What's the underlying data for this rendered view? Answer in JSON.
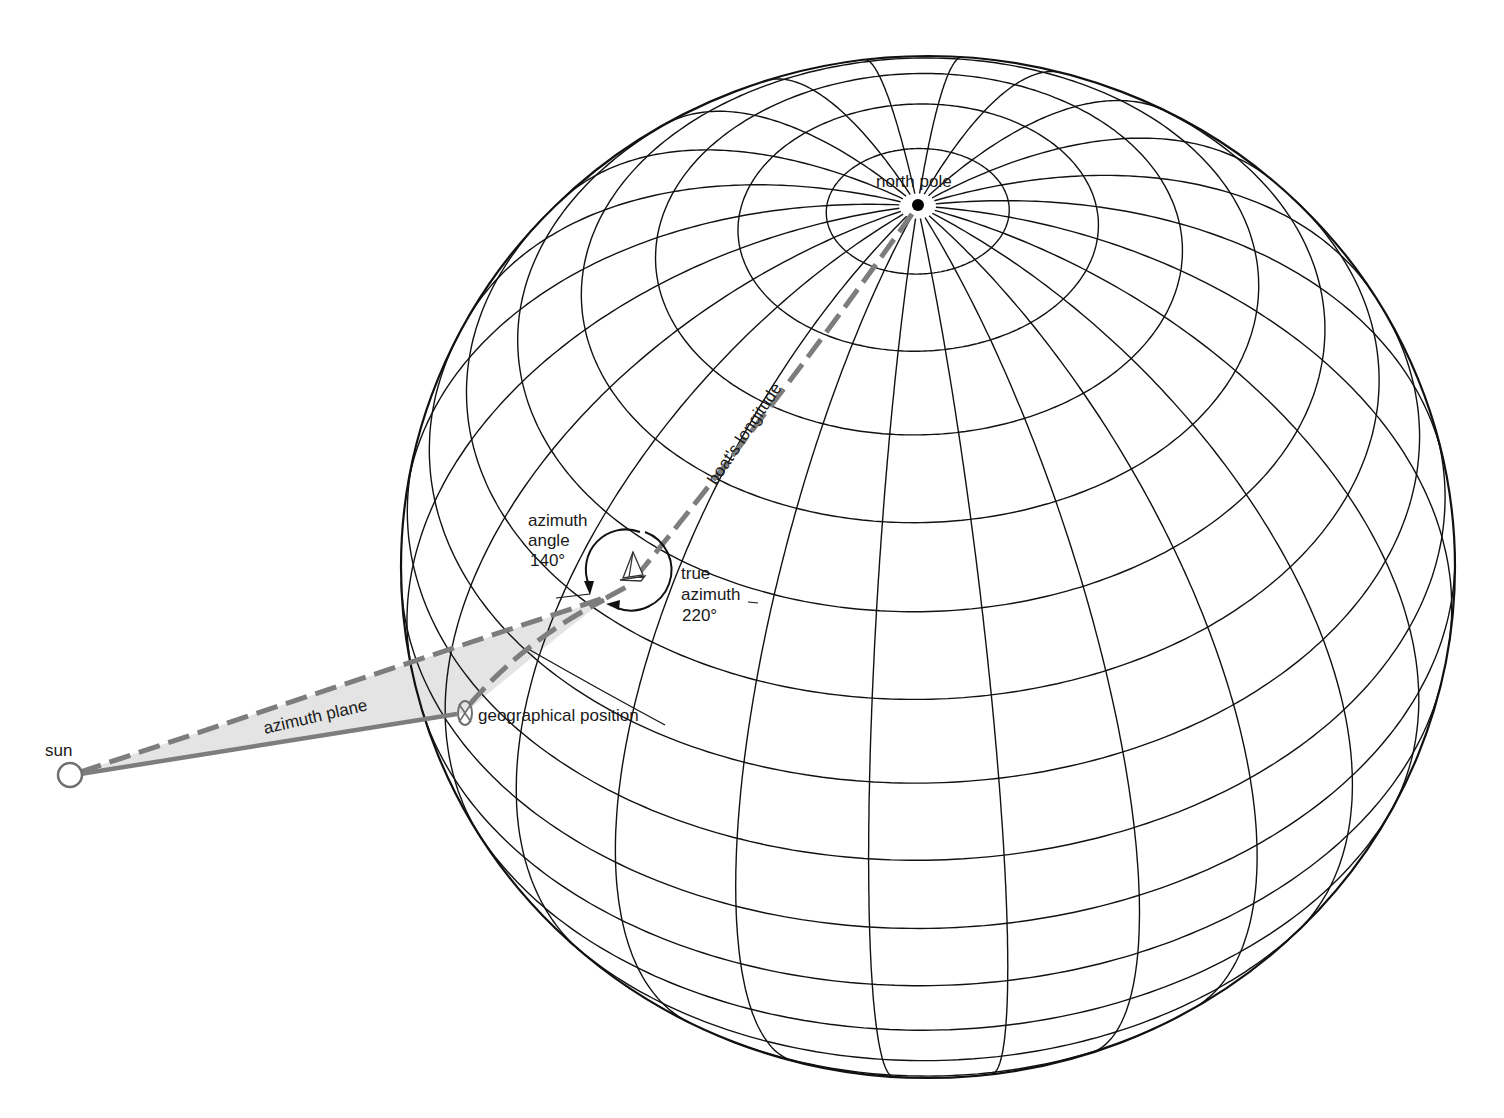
{
  "diagram": {
    "labels": {
      "north_pole": "north pole",
      "boats_longitude": "boat's longitude",
      "azimuth_angle_line1": "azimuth",
      "azimuth_angle_line2": "angle",
      "azimuth_angle_value": "140°",
      "true_azimuth_line1": "true",
      "true_azimuth_line2": "azimuth",
      "true_azimuth_value": "220°",
      "azimuth_plane": "azimuth plane",
      "geographical_position": "geographical position",
      "sun": "sun"
    },
    "values": {
      "azimuth_angle_deg": 140,
      "true_azimuth_deg": 220
    },
    "colors": {
      "grid": "#111111",
      "construction_gray": "#7d7d7d",
      "plane_fill": "#e4e4e4",
      "background": "#ffffff"
    },
    "globe": {
      "center_x": 928,
      "center_y": 567,
      "radius_x": 527,
      "radius_y": 511,
      "tilt_deg": 45,
      "roll_deg": -1.6,
      "meridian_step_deg": 15,
      "latitude_step_deg": 10,
      "north_pole_xy": [
        918,
        205
      ]
    },
    "points": {
      "sun": [
        70,
        775
      ],
      "sun_radius": 12,
      "boat_observer": [
        607,
        598
      ],
      "boat_icon": [
        632,
        565
      ],
      "geographical_position": [
        465,
        713
      ],
      "azimuth_circle_center": [
        625,
        569
      ],
      "azimuth_circle_radius": 40
    }
  }
}
